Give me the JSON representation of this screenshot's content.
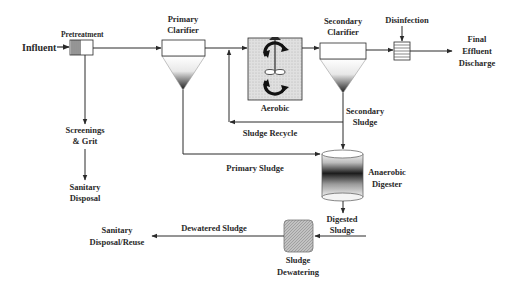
{
  "colors": {
    "line": "#2a2a2a",
    "text": "#2a2a2a",
    "aerobic_fill": "#d9d9d9",
    "dewatering_fill": "#bdbdbd"
  },
  "nodes": {
    "influent": {
      "label": "Influent"
    },
    "pretreatment": {
      "label": "Pretreatment"
    },
    "primary_clarifier": {
      "line1": "Primary",
      "line2": "Clarifier"
    },
    "aerobic": {
      "label": "Aerobic"
    },
    "secondary_clarifier": {
      "line1": "Secondary",
      "line2": "Clarifier"
    },
    "disinfection": {
      "label": "Disinfection"
    },
    "final_effluent": {
      "line1": "Final",
      "line2": "Effluent",
      "line3": "Discharge"
    },
    "screenings": {
      "line1": "Screenings",
      "line2": "& Grit"
    },
    "sanitary_disposal": {
      "line1": "Sanitary",
      "line2": "Disposal"
    },
    "secondary_sludge": {
      "line1": "Secondary",
      "line2": "Sludge"
    },
    "anaerobic_digester": {
      "line1": "Anaerobic",
      "line2": "Digester"
    },
    "digested_sludge": {
      "line1": "Digested",
      "line2": "Sludge"
    },
    "sludge_dewatering": {
      "line1": "Sludge",
      "line2": "Dewatering"
    },
    "sanitary_disposal_reuse": {
      "line1": "Sanitary",
      "line2": "Disposal/Reuse"
    }
  },
  "flows": {
    "sludge_recycle": "Sludge Recycle",
    "primary_sludge": "Primary Sludge",
    "dewatered_sludge": "Dewatered Sludge"
  }
}
